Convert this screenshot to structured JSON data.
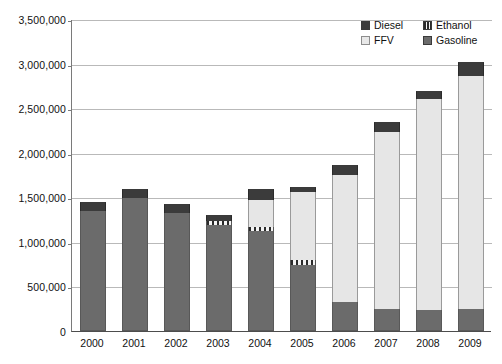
{
  "chart_data": {
    "type": "bar",
    "subtype": "stacked-vertical",
    "title": "",
    "subtitle": "",
    "xlabel": "",
    "ylabel": "",
    "grid": true,
    "legend_position": "top-right",
    "ylim": [
      0,
      3500000
    ],
    "ytick_step": 500000,
    "ytick_labels": [
      "3,500,000",
      "3,000,000",
      "2,500,000",
      "2,000,000",
      "1,500,000",
      "1,000,000",
      "500,000",
      "0"
    ],
    "ytick_values": [
      3500000,
      3000000,
      2500000,
      2000000,
      1500000,
      1000000,
      500000,
      0
    ],
    "categories": [
      "2000",
      "2001",
      "2002",
      "2003",
      "2004",
      "2005",
      "2006",
      "2007",
      "2008",
      "2009"
    ],
    "stack_order_bottom_to_top": [
      "Gasoline",
      "Ethanol",
      "FFV",
      "Diesel"
    ],
    "series": [
      {
        "name": "Gasoline",
        "color": "#6b6b6b",
        "values": [
          1347000,
          1494000,
          1325000,
          1190000,
          1122000,
          740000,
          325000,
          250000,
          235000,
          245000
        ]
      },
      {
        "name": "Ethanol",
        "color": "#f4f4f4",
        "pattern": "vertical-hatch",
        "values": [
          0,
          0,
          0,
          45000,
          50000,
          55000,
          0,
          0,
          0,
          0
        ]
      },
      {
        "name": "FFV",
        "color": "#e6e6e6",
        "values": [
          0,
          0,
          0,
          0,
          300000,
          765000,
          1425000,
          1985000,
          2370000,
          2620000
        ]
      },
      {
        "name": "Diesel",
        "color": "#3b3b3b",
        "values": [
          100000,
          100000,
          100000,
          67000,
          122000,
          56000,
          113000,
          110000,
          89000,
          155000
        ]
      }
    ],
    "totals": [
      1447000,
      1594000,
      1425000,
      1302000,
      1594000,
      1616000,
      1863000,
      2345000,
      2694000,
      3020000
    ]
  },
  "legend": {
    "items": [
      {
        "label": "Diesel",
        "swatch": "swatch-diesel"
      },
      {
        "label": "Ethanol",
        "swatch": "swatch-ethanol"
      },
      {
        "label": "FFV",
        "swatch": "swatch-ffv"
      },
      {
        "label": "Gasoline",
        "swatch": "swatch-gasoline"
      }
    ]
  }
}
